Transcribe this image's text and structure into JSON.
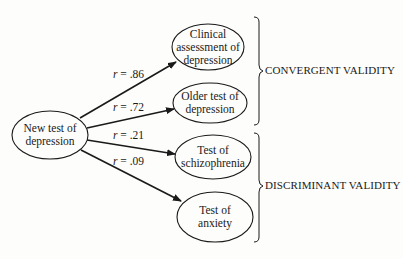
{
  "diagram": {
    "source_node": {
      "line1": "New test of",
      "line2": "depression"
    },
    "targets": [
      {
        "line1": "Clinical",
        "line2": "assessment of",
        "line3": "depression",
        "r": ".86"
      },
      {
        "line1": "Older test of",
        "line2": "depression",
        "r": ".72"
      },
      {
        "line1": "Test of",
        "line2": "schizophrenia",
        "r": ".21"
      },
      {
        "line1": "Test of",
        "line2": "anxiety",
        "r": ".09"
      }
    ],
    "r_prefix": "r",
    "r_equals": " = ",
    "groups": [
      {
        "label": "CONVERGENT VALIDITY"
      },
      {
        "label": "DISCRIMINANT VALIDITY"
      }
    ]
  }
}
